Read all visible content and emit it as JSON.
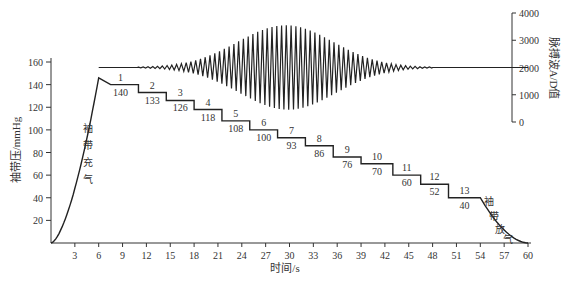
{
  "chart_data": {
    "type": "line",
    "title": "",
    "xlabel": "时间/s",
    "ylabel": "袖带压/mmHg",
    "y2label": "脉搏波A/D值",
    "xlim": [
      0,
      60
    ],
    "ylim": [
      0,
      160
    ],
    "y2lim": [
      0,
      4000
    ],
    "x_ticks": [
      3,
      6,
      9,
      12,
      15,
      18,
      21,
      24,
      27,
      30,
      33,
      36,
      39,
      42,
      45,
      48,
      51,
      54,
      57,
      60
    ],
    "y_ticks": [
      20,
      40,
      60,
      80,
      100,
      120,
      140,
      160
    ],
    "y2_ticks": [
      0,
      1000,
      2000,
      3000,
      4000
    ],
    "grid": false,
    "annotations": {
      "inflate": [
        "袖",
        "带",
        "充",
        "气"
      ],
      "deflate": [
        "袖",
        "带",
        "放",
        "气"
      ]
    },
    "steps": [
      {
        "index": "1",
        "pressure": "140",
        "start": 6.5,
        "end": 11
      },
      {
        "index": "2",
        "pressure": "133",
        "start": 11,
        "end": 14.5
      },
      {
        "index": "3",
        "pressure": "126",
        "start": 14.5,
        "end": 18
      },
      {
        "index": "4",
        "pressure": "118",
        "start": 18,
        "end": 21.5
      },
      {
        "index": "5",
        "pressure": "108",
        "start": 21.5,
        "end": 25
      },
      {
        "index": "6",
        "pressure": "100",
        "start": 25,
        "end": 28.5
      },
      {
        "index": "7",
        "pressure": "93",
        "start": 28.5,
        "end": 32
      },
      {
        "index": "8",
        "pressure": "86",
        "start": 32,
        "end": 35.5
      },
      {
        "index": "9",
        "pressure": "76",
        "start": 35.5,
        "end": 39
      },
      {
        "index": "10",
        "pressure": "70",
        "start": 39,
        "end": 43
      },
      {
        "index": "11",
        "pressure": "60",
        "start": 43,
        "end": 46.5
      },
      {
        "index": "12",
        "pressure": "52",
        "start": 46.5,
        "end": 50
      },
      {
        "index": "13",
        "pressure": "40",
        "start": 50,
        "end": 54
      }
    ],
    "series": [
      {
        "name": "袖带压",
        "axis": "left",
        "description": "inflate 0→146 mmHg by ~6s, then stepwise deflation 140→40 mmHg, then exhaust to 0 at 60s"
      },
      {
        "name": "脉搏波A/D值",
        "axis": "right",
        "baseline": 2000,
        "description": "oscillation around 2000 starting ~11s, amplitude peaking ~±1500 near 27–33s, decaying to flat by ~48s"
      }
    ]
  }
}
